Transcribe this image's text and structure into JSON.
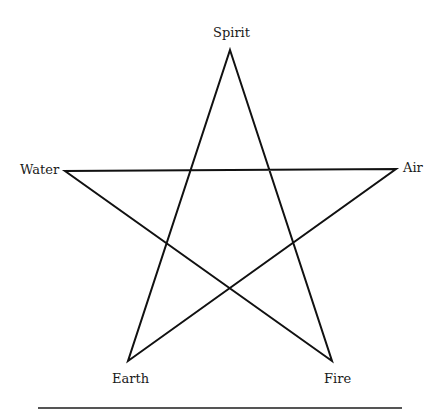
{
  "diagram": {
    "type": "pentagram",
    "stroke_color": "#111111",
    "stroke_width": 2,
    "points": {
      "spirit": {
        "label": "Spirit",
        "x": 230,
        "y": 50
      },
      "air": {
        "label": "Air",
        "x": 396,
        "y": 169
      },
      "fire": {
        "label": "Fire",
        "x": 332,
        "y": 361
      },
      "earth": {
        "label": "Earth",
        "x": 128,
        "y": 361
      },
      "water": {
        "label": "Water",
        "x": 65,
        "y": 171
      }
    },
    "edges": [
      [
        "spirit",
        "fire"
      ],
      [
        "fire",
        "water"
      ],
      [
        "water",
        "air"
      ],
      [
        "air",
        "earth"
      ],
      [
        "earth",
        "spirit"
      ]
    ]
  },
  "labels": {
    "spirit": "Spirit",
    "water": "Water",
    "air": "Air",
    "earth": "Earth",
    "fire": "Fire"
  },
  "rule_color": "#555555"
}
